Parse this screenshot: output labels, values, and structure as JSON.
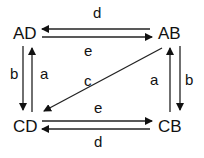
{
  "diagram": {
    "nodes": [
      {
        "id": "AD",
        "label": "AD"
      },
      {
        "id": "AB",
        "label": "AB"
      },
      {
        "id": "CD",
        "label": "CD"
      },
      {
        "id": "CB",
        "label": "CB"
      }
    ],
    "edges": [
      {
        "from": "AB",
        "to": "AD",
        "label": "d"
      },
      {
        "from": "AD",
        "to": "AB",
        "label": "e"
      },
      {
        "from": "AD",
        "to": "CD",
        "label": "b"
      },
      {
        "from": "CD",
        "to": "AD",
        "label": "a"
      },
      {
        "from": "AB",
        "to": "CD",
        "label": "c"
      },
      {
        "from": "CB",
        "to": "AB",
        "label": "a"
      },
      {
        "from": "AB",
        "to": "CB",
        "label": "b"
      },
      {
        "from": "CD",
        "to": "CB",
        "label": "e"
      },
      {
        "from": "CB",
        "to": "CD",
        "label": "d"
      }
    ]
  }
}
